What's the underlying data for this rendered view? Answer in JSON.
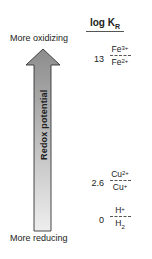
{
  "diagram": {
    "header": {
      "text": "log K",
      "subscript": "R"
    },
    "top_label": "More oxidizing",
    "bottom_label": "More reducing",
    "arrow": {
      "label": "Redox potential",
      "direction": "up",
      "gradient_top": "#8c8c8c",
      "gradient_bottom": "#ececec"
    },
    "couples": [
      {
        "value": "13",
        "oxidized": "Fe",
        "oxidized_charge": "3+",
        "reduced": "Fe",
        "reduced_charge": "2+",
        "reduced_subscript": ""
      },
      {
        "value": "2.6",
        "oxidized": "Cu",
        "oxidized_charge": "2+",
        "reduced": "Cu",
        "reduced_charge": "+",
        "reduced_subscript": ""
      },
      {
        "value": "0",
        "oxidized": "H",
        "oxidized_charge": "+",
        "reduced": "H",
        "reduced_charge": "",
        "reduced_subscript": "2"
      }
    ]
  }
}
